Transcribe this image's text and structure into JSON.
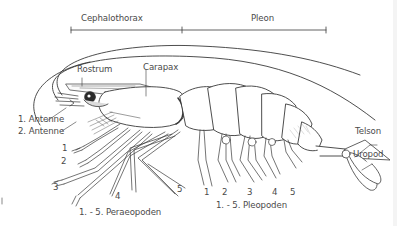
{
  "diagram": {
    "regions": {
      "cephalothorax": "Cephalothorax",
      "pleon": "Pleon"
    },
    "labels": {
      "rostrum": "Rostrum",
      "carapax": "Carapax",
      "antenne1": "1. Antenne",
      "antenne2": "2. Antenne",
      "telson": "Telson",
      "uropod": "Uropod",
      "peraeopoden": "1. - 5. Peraeopoden",
      "pleopoden": "1. - 5. Pleopoden"
    },
    "peraeopod_numbers": [
      "1",
      "2",
      "3",
      "4",
      "5"
    ],
    "pleopod_numbers": [
      "1",
      "2",
      "3",
      "4",
      "5"
    ],
    "colors": {
      "line": "#3a3a3a",
      "text": "#4a4a4a",
      "background": "#ffffff"
    }
  }
}
